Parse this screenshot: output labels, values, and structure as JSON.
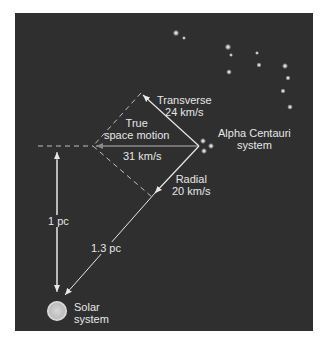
{
  "figure": {
    "colors": {
      "background": "#2f2f2f",
      "lines": "#e8e8e8",
      "text": "#e6e6e6",
      "sun": "#c8c8c8"
    },
    "labels": {
      "transverse": "Transverse",
      "transverse_speed": "24 km/s",
      "true_motion_1": "True",
      "true_motion_2": "space motion",
      "true_speed": "31 km/s",
      "star_1": "Alpha Centauri",
      "star_2": "system",
      "radial": "Radial",
      "radial_speed": "20 km/s",
      "dist_perp": "1 pc",
      "dist_los": "1.3 pc",
      "sun_1": "Solar",
      "sun_2": "system"
    }
  }
}
